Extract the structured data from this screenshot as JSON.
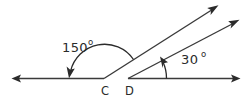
{
  "figure": {
    "kind": "geometry-angle-diagram",
    "background_color": "#ffffff",
    "line_color": "#3a3a3a",
    "text_color": "#2b2b2b",
    "vertices": [
      {
        "id": "C",
        "label": "C",
        "x": 104,
        "y": 78,
        "label_x": 101,
        "label_y": 95
      },
      {
        "id": "D",
        "label": "D",
        "x": 128,
        "y": 78,
        "label_x": 125,
        "label_y": 95
      }
    ],
    "angles": [
      {
        "id": "angle-at-C",
        "value": "150",
        "degree_symbol": "o",
        "vertex": "C",
        "label_x": 62,
        "label_y": 52,
        "degree_x": 88,
        "degree_y": 45
      },
      {
        "id": "angle-at-D",
        "value": "30",
        "degree_symbol": "o",
        "vertex": "D",
        "label_x": 181,
        "label_y": 64,
        "degree_x": 201,
        "degree_y": 57
      }
    ],
    "rays": [
      {
        "id": "ray-C-left",
        "from": "C",
        "direction": "left",
        "arrow_tip_x": 12,
        "arrow_tip_y": 78
      },
      {
        "id": "ray-C-upright",
        "from": "C",
        "direction": "up-right",
        "arrow_tip_x": 218,
        "arrow_tip_y": 5
      },
      {
        "id": "ray-D-right",
        "from": "D",
        "direction": "right",
        "arrow_tip_x": 240,
        "arrow_tip_y": 78
      },
      {
        "id": "ray-D-upright",
        "from": "D",
        "direction": "up-right",
        "arrow_tip_x": 239,
        "arrow_tip_y": 19
      }
    ]
  }
}
